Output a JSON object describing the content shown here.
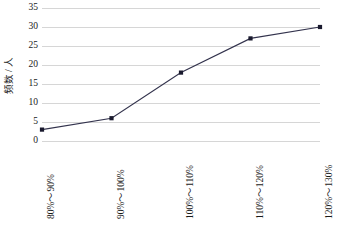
{
  "chart_data": {
    "type": "line",
    "title": "",
    "subtitle": "",
    "xlabel": "",
    "ylabel": "频数 / 人",
    "categories": [
      "80%～90%",
      "90%～100%",
      "100%～110%",
      "110%～120%",
      "120%～130%"
    ],
    "values": [
      3,
      6,
      18,
      27,
      30
    ],
    "series": [
      {
        "name": "频数",
        "values": [
          3,
          6,
          18,
          27,
          30
        ]
      }
    ],
    "ylim": [
      0,
      35
    ],
    "yticks": [
      0,
      5,
      10,
      15,
      20,
      25,
      30,
      35
    ],
    "ytick_labels": [
      "0",
      "5",
      "10",
      "15",
      "20",
      "25",
      "30",
      "35"
    ],
    "grid": "horizontal",
    "legend": "none",
    "marker": "square",
    "line_color": "#33334d",
    "marker_color": "#1a1a2e",
    "grid_color": "#d6d6d6",
    "background_color": "#ffffff"
  }
}
